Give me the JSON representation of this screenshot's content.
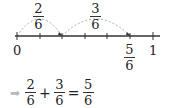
{
  "number_line": {
    "start_label": "0",
    "end_label": "1",
    "divisions": 6,
    "marker_label": {
      "num": "5",
      "den": "6"
    }
  },
  "jumps": [
    {
      "num": "2",
      "den": "6"
    },
    {
      "num": "3",
      "den": "6"
    }
  ],
  "equation": {
    "arrow": "➡",
    "terms": [
      {
        "num": "2",
        "den": "6"
      },
      {
        "op": "+"
      },
      {
        "num": "3",
        "den": "6"
      },
      {
        "op": "="
      },
      {
        "num": "5",
        "den": "6"
      }
    ]
  }
}
